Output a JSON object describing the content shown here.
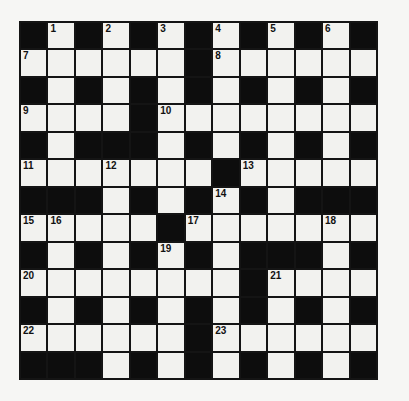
{
  "puzzle": {
    "type": "crossword",
    "rows": 13,
    "cols": 13,
    "colors": {
      "black_cell": "#0d0d0d",
      "white_cell": "#f2f2ef",
      "grid_line": "#141414",
      "page_background": "#f6f6f4",
      "number_color": "#111111"
    },
    "layout": [
      "#.#.#.#.#.#.#",
      "......#......",
      "#.#.#.#.#.#.#",
      "....#........",
      "#.###.#.#.#.#",
      ".......#.....",
      "###.#.#.#.###",
      ".....#.......",
      "#.#.#.#.###.#",
      "........#....",
      "#.#.#.#.#.#.#",
      "......#......",
      "###.#.#.#.#.#"
    ],
    "numbers": [
      {
        "row": 0,
        "col": 1,
        "label": "1"
      },
      {
        "row": 0,
        "col": 3,
        "label": "2"
      },
      {
        "row": 0,
        "col": 5,
        "label": "3"
      },
      {
        "row": 0,
        "col": 7,
        "label": "4"
      },
      {
        "row": 0,
        "col": 9,
        "label": "5"
      },
      {
        "row": 0,
        "col": 11,
        "label": "6"
      },
      {
        "row": 1,
        "col": 0,
        "label": "7"
      },
      {
        "row": 1,
        "col": 7,
        "label": "8"
      },
      {
        "row": 3,
        "col": 0,
        "label": "9"
      },
      {
        "row": 3,
        "col": 5,
        "label": "10"
      },
      {
        "row": 5,
        "col": 0,
        "label": "11"
      },
      {
        "row": 5,
        "col": 3,
        "label": "12"
      },
      {
        "row": 5,
        "col": 8,
        "label": "13"
      },
      {
        "row": 6,
        "col": 7,
        "label": "14"
      },
      {
        "row": 7,
        "col": 0,
        "label": "15"
      },
      {
        "row": 7,
        "col": 1,
        "label": "16"
      },
      {
        "row": 7,
        "col": 6,
        "label": "17"
      },
      {
        "row": 7,
        "col": 11,
        "label": "18"
      },
      {
        "row": 8,
        "col": 5,
        "label": "19"
      },
      {
        "row": 9,
        "col": 0,
        "label": "20"
      },
      {
        "row": 9,
        "col": 9,
        "label": "21"
      },
      {
        "row": 11,
        "col": 0,
        "label": "22"
      },
      {
        "row": 11,
        "col": 7,
        "label": "23"
      }
    ]
  }
}
